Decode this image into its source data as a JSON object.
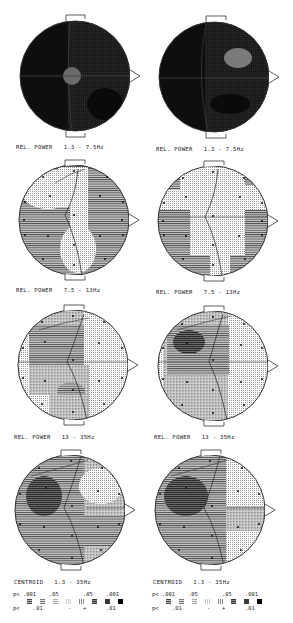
{
  "figure": {
    "panels": [
      {
        "id": "a1",
        "label": "REL. POWER   1.3 - 7.5Hz",
        "x": 10,
        "y": 14,
        "style": "dark",
        "blobs": [
          {
            "cx": 62,
            "cy": 63,
            "rx": 9,
            "ry": 9,
            "fill": "#6a6a6a"
          }
        ]
      },
      {
        "id": "a2",
        "label": "REL. POWER   1.3 - 7.5Hz",
        "x": 150,
        "y": 14,
        "style": "dark",
        "blobs": [
          {
            "cx": 88,
            "cy": 40,
            "rx": 14,
            "ry": 10,
            "fill": "#7a7a7a"
          }
        ]
      },
      {
        "id": "b1",
        "label": "REL. POWER   7.5 - 13Hz",
        "x": 10,
        "y": 158,
        "style": "alpha1"
      },
      {
        "id": "b2",
        "label": "REL. POWER   7.5 - 13Hz",
        "x": 150,
        "y": 158,
        "style": "alpha2"
      },
      {
        "id": "c1",
        "label": "REL. POWER   13 - 35Hz",
        "x": 9,
        "y": 302,
        "style": "beta1"
      },
      {
        "id": "c2",
        "label": "REL. POWER   13 - 35Hz",
        "x": 149,
        "y": 302,
        "style": "beta2"
      },
      {
        "id": "d1",
        "label": "CENTROID   1.3 - 35Hz",
        "x": 6,
        "y": 447,
        "style": "cent1"
      },
      {
        "id": "d2",
        "label": "CENTROID   1.3 - 35Hz",
        "x": 146,
        "y": 447,
        "style": "cent2"
      }
    ],
    "legend": {
      "top_row": [
        "p<",
        ".001",
        ".05",
        ".05",
        ".001"
      ],
      "bottom_row": [
        "p<",
        ".01",
        "-",
        "+",
        ".01"
      ],
      "swatches": [
        "hatch-dense-gray",
        "hatch-medium",
        "hatch-light",
        "dots-light",
        "dots-dense",
        "hatch-dark",
        "dark-gray",
        "black"
      ]
    }
  },
  "labels": {
    "a1": "REL. POWER   1.3 - 7.5Hz",
    "a2": "REL. POWER   1.3 - 7.5Hz",
    "b1": "REL. POWER   7.5 - 13Hz",
    "b2": "REL. POWER   7.5 - 13Hz",
    "c1": "REL. POWER   13 - 35Hz",
    "c2": "REL. POWER   13 - 35Hz",
    "d1": "CENTROID   1.3 - 35Hz",
    "d2": "CENTROID   1.3 - 35Hz"
  },
  "legend_text": {
    "p_top": "p<",
    "v001a": ".001",
    "v05a": ".05",
    "v05b": ".05",
    "v001b": ".001",
    "p_bottom": "p<",
    "v01a": ".01",
    "minus": "-",
    "plus": "+",
    "v01b": ".01"
  }
}
